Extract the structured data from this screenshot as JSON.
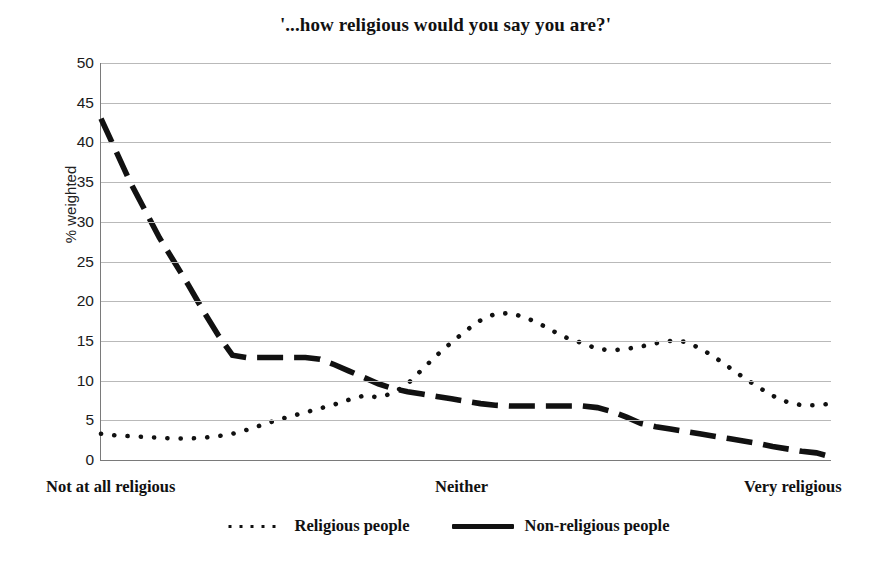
{
  "chart_data": {
    "type": "line",
    "title": "'...how religious would you say you are?'",
    "xlabel": "",
    "ylabel": "% weighted",
    "ylim": [
      0,
      50
    ],
    "yticks": [
      0,
      5,
      10,
      15,
      20,
      25,
      30,
      35,
      40,
      45,
      50
    ],
    "ytick_labels": [
      "0",
      "5",
      "10",
      "15",
      "20",
      "25",
      "30",
      "35",
      "40",
      "45",
      "50"
    ],
    "xtick_labels": [
      "Not at all religious",
      "Neither",
      "Very religious"
    ],
    "xtick_positions": [
      0,
      0.5,
      1
    ],
    "grid": true,
    "grid_axis": "y",
    "legend_position": "bottom",
    "x": [
      0,
      1,
      2,
      3,
      4,
      5,
      6,
      7,
      8,
      9,
      10,
      11,
      12,
      13,
      14,
      15,
      16,
      17,
      18,
      19,
      20,
      21,
      22,
      23,
      24,
      25,
      26,
      27,
      28,
      29,
      30,
      31,
      32,
      33,
      34,
      35,
      36,
      37,
      38,
      39,
      40,
      41,
      42,
      43,
      44,
      45,
      46,
      47,
      48,
      49,
      50
    ],
    "series": [
      {
        "name": "Religious people",
        "style": "dotted",
        "color": "#111111",
        "values": [
          3.3,
          3.1,
          3.0,
          2.9,
          2.8,
          2.7,
          2.7,
          2.8,
          3.0,
          3.3,
          3.8,
          4.4,
          5.0,
          5.5,
          6.0,
          6.5,
          7.0,
          7.6,
          8.1,
          7.9,
          8.4,
          9.6,
          11.4,
          13.2,
          14.8,
          16.3,
          17.6,
          18.4,
          18.5,
          18.0,
          17.2,
          16.2,
          15.3,
          14.7,
          14.0,
          13.8,
          14.0,
          14.3,
          14.7,
          15.0,
          14.9,
          14.1,
          13.0,
          11.7,
          10.4,
          9.2,
          8.1,
          7.3,
          6.9,
          6.9,
          7.1
        ]
      },
      {
        "name": "Non-religious people",
        "style": "dashed",
        "color": "#111111",
        "values": [
          43.0,
          39.0,
          35.0,
          31.5,
          28.0,
          25.0,
          22.0,
          18.8,
          15.8,
          13.2,
          12.9,
          12.9,
          12.9,
          12.9,
          12.9,
          12.7,
          12.0,
          11.2,
          10.4,
          9.6,
          9.0,
          8.6,
          8.3,
          8.0,
          7.7,
          7.4,
          7.1,
          6.9,
          6.8,
          6.8,
          6.8,
          6.8,
          6.8,
          6.8,
          6.6,
          6.1,
          5.4,
          4.6,
          4.2,
          3.9,
          3.6,
          3.3,
          3.0,
          2.7,
          2.4,
          2.1,
          1.7,
          1.4,
          1.1,
          0.9,
          0.4
        ]
      }
    ]
  },
  "legend": {
    "items": [
      {
        "label": "Religious people",
        "marker": "dotted-line-swatch"
      },
      {
        "label": "Non-religious people",
        "marker": "solid-line-swatch"
      }
    ]
  }
}
